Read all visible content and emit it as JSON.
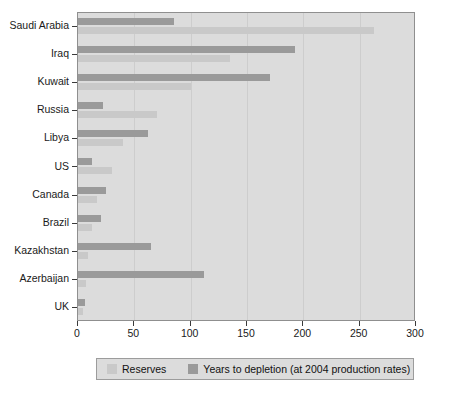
{
  "chart_data": {
    "type": "bar",
    "orientation": "horizontal",
    "title": "",
    "subtitle": "",
    "xlabel": "",
    "ylabel": "",
    "xlim": [
      0,
      300
    ],
    "xticks": [
      0,
      50,
      100,
      150,
      200,
      250,
      300
    ],
    "grid": true,
    "grid_axis": "x",
    "legend_position": "bottom",
    "categories": [
      "Saudi Arabia",
      "Iraq",
      "Kuwait",
      "Russia",
      "Libya",
      "US",
      "Canada",
      "Brazil",
      "Kazakhstan",
      "Azerbaijan",
      "UK"
    ],
    "series": [
      {
        "name": "Reserves",
        "color": "#c9c9c9",
        "values": [
          263,
          135,
          100,
          70,
          40,
          30,
          17,
          12,
          9,
          7,
          4
        ]
      },
      {
        "name": "Years to depletion (at 2004 production rates)",
        "color": "#9a9a9a",
        "values": [
          85,
          193,
          170,
          22,
          62,
          12,
          25,
          20,
          65,
          112,
          6
        ]
      }
    ]
  },
  "axis": {
    "x_tick_labels": [
      "0",
      "50",
      "100",
      "150",
      "200",
      "250",
      "300"
    ]
  },
  "legend": {
    "items": [
      {
        "label": "Reserves",
        "swatch": "reserves-swatch"
      },
      {
        "label": "Years to depletion (at 2004 production rates)",
        "swatch": "depletion-swatch"
      }
    ]
  },
  "colors": {
    "reserves": "#c9c9c9",
    "depletion": "#9a9a9a",
    "plot_background": "#dcdcdc",
    "gridline": "#cdcdcd",
    "axis": "#3a3a3a"
  }
}
